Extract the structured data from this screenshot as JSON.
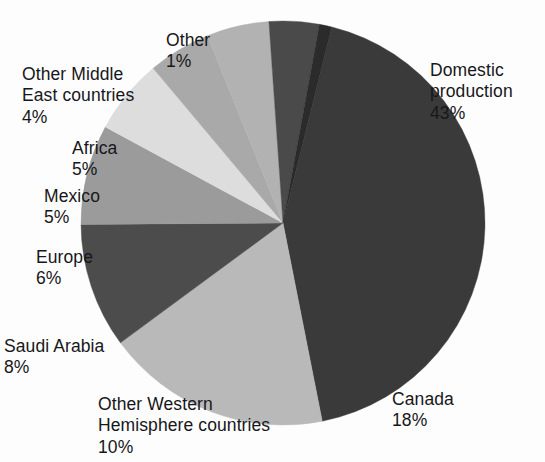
{
  "chart_data": {
    "type": "pie",
    "title": "",
    "subtitle": "",
    "xlabel": "",
    "ylabel": "",
    "legend_position": "none",
    "grid": false,
    "units": "percent",
    "total": 100,
    "categories": [
      "Domestic production",
      "Canada",
      "Other Western Hemisphere countries",
      "Saudi Arabia",
      "Europe",
      "Mexico",
      "Africa",
      "Other Middle East countries",
      "Other"
    ],
    "values": [
      43,
      18,
      10,
      8,
      6,
      5,
      5,
      4,
      1
    ],
    "slices": [
      {
        "label": "Domestic production",
        "label_lines": "Domestic\nproduction",
        "value": 43,
        "pct_text": "43%",
        "color": "#3a3a3a"
      },
      {
        "label": "Canada",
        "label_lines": "Canada",
        "value": 18,
        "pct_text": "18%",
        "color": "#b9b9b9"
      },
      {
        "label": "Other Western Hemisphere countries",
        "label_lines": "Other Western\nHemisphere countries",
        "value": 10,
        "pct_text": "10%",
        "color": "#4c4c4c"
      },
      {
        "label": "Saudi Arabia",
        "label_lines": "Saudi Arabia",
        "value": 8,
        "pct_text": "8%",
        "color": "#9b9b9b"
      },
      {
        "label": "Europe",
        "label_lines": "Europe",
        "value": 6,
        "pct_text": "6%",
        "color": "#dddddd"
      },
      {
        "label": "Mexico",
        "label_lines": "Mexico",
        "value": 5,
        "pct_text": "5%",
        "color": "#a9a9a9"
      },
      {
        "label": "Africa",
        "label_lines": "Africa",
        "value": 5,
        "pct_text": "5%",
        "color": "#b2b2b2"
      },
      {
        "label": "Other Middle East countries",
        "label_lines": "Other Middle\nEast countries",
        "value": 4,
        "pct_text": "4%",
        "color": "#4a4a4a"
      },
      {
        "label": "Other",
        "label_lines": "Other",
        "value": 1,
        "pct_text": "1%",
        "color": "#2b2b2b"
      }
    ]
  },
  "labels": {
    "domestic": {
      "name": "Domestic\nproduction",
      "pct": "43%"
    },
    "canada": {
      "name": "Canada",
      "pct": "18%"
    },
    "other_western": {
      "name": "Other Western\nHemisphere countries",
      "pct": "10%"
    },
    "saudi": {
      "name": "Saudi Arabia",
      "pct": "8%"
    },
    "europe": {
      "name": "Europe",
      "pct": "6%"
    },
    "mexico": {
      "name": "Mexico",
      "pct": "5%"
    },
    "africa": {
      "name": "Africa",
      "pct": "5%"
    },
    "other_middle_east": {
      "name": "Other Middle\nEast countries",
      "pct": "4%"
    },
    "other": {
      "name": "Other",
      "pct": "1%"
    }
  },
  "style": {
    "background": "#fdfdfd",
    "text_color": "#17171a",
    "pie_center_x": 283,
    "pie_center_y": 223,
    "pie_radius": 202,
    "start_angle_deg": -76
  }
}
